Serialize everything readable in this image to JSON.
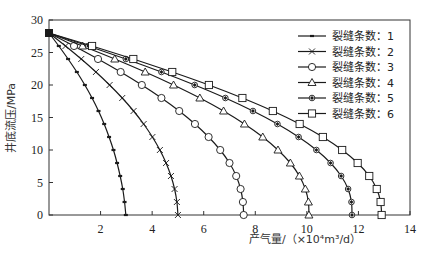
{
  "chart_data": {
    "type": "line",
    "title": "",
    "xlabel": "产气量/（×10⁴m³/d）",
    "ylabel": "井底流压/MPa",
    "xlim": [
      0,
      14
    ],
    "ylim": [
      0,
      30
    ],
    "xticks": [
      2,
      4,
      6,
      8,
      10,
      12,
      14
    ],
    "yticks": [
      0,
      5,
      10,
      15,
      20,
      25,
      30
    ],
    "grid": false,
    "legend_position": "upper right",
    "series": [
      {
        "name": "裂缝条数：1",
        "marker": "dash",
        "x": [
          0,
          0.38,
          0.74,
          1.08,
          1.39,
          1.67,
          1.92,
          2.14,
          2.33,
          2.5,
          2.64,
          2.76,
          2.86,
          2.93,
          2.98
        ],
        "y": [
          28,
          26,
          24,
          22,
          20,
          18,
          16,
          14,
          12,
          10,
          8,
          6,
          4,
          2,
          0
        ]
      },
      {
        "name": "裂缝条数：2",
        "marker": "x",
        "x": [
          0,
          0.64,
          1.25,
          1.82,
          2.35,
          2.84,
          3.28,
          3.67,
          4.01,
          4.3,
          4.54,
          4.73,
          4.87,
          4.96,
          5.0
        ],
        "y": [
          28,
          26,
          24,
          22,
          20,
          18,
          16,
          14,
          12,
          10,
          8,
          6,
          4,
          2,
          0
        ]
      },
      {
        "name": "裂缝条数：3",
        "marker": "circle",
        "x": [
          0,
          0.97,
          1.9,
          2.78,
          3.6,
          4.36,
          5.05,
          5.66,
          6.19,
          6.64,
          7.0,
          7.26,
          7.43,
          7.52,
          7.55
        ],
        "y": [
          28,
          26,
          24,
          22,
          20,
          18,
          16,
          14,
          12,
          10,
          8,
          6,
          4,
          2,
          0
        ]
      },
      {
        "name": "裂缝条数：4",
        "marker": "triangle",
        "x": [
          0,
          1.3,
          2.55,
          3.73,
          4.83,
          5.85,
          6.77,
          7.58,
          8.29,
          8.88,
          9.36,
          9.71,
          9.94,
          10.06,
          10.08
        ],
        "y": [
          28,
          26,
          24,
          22,
          20,
          18,
          16,
          14,
          12,
          10,
          8,
          6,
          4,
          2,
          0
        ]
      },
      {
        "name": "裂缝条数：5",
        "marker": "diamond-circle",
        "x": [
          0,
          1.52,
          2.98,
          4.36,
          5.65,
          6.84,
          7.91,
          8.86,
          9.68,
          10.37,
          10.92,
          11.33,
          11.6,
          11.73,
          11.75
        ],
        "y": [
          28,
          26,
          24,
          22,
          20,
          18,
          16,
          14,
          12,
          10,
          8,
          6,
          4,
          2,
          0
        ]
      },
      {
        "name": "裂缝条数：6",
        "marker": "square",
        "x": [
          0,
          1.67,
          3.27,
          4.78,
          6.2,
          7.5,
          8.68,
          9.72,
          10.62,
          11.37,
          11.97,
          12.42,
          12.71,
          12.86,
          12.9
        ],
        "y": [
          28,
          26,
          24,
          22,
          20,
          18,
          16,
          14,
          12,
          10,
          8,
          6,
          4,
          2,
          0
        ]
      }
    ]
  },
  "plot_area": {
    "left": 49,
    "right": 410,
    "top": 20,
    "bottom": 215
  },
  "colors": {
    "line": "#1a1a1a",
    "axis": "#333333",
    "background": "#ffffff"
  }
}
